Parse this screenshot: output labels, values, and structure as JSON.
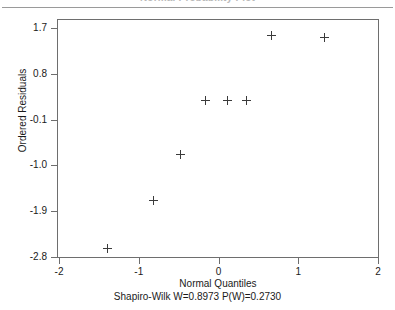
{
  "figure": {
    "cutoff_title": "Normal Probability Plot",
    "has_top_rule": true
  },
  "chart_data": {
    "type": "scatter",
    "title": "",
    "xlabel": "Normal Quantiles",
    "ylabel": "Ordered Residuals",
    "subtitle": "Shapiro-Wilk W=0.8973  P(W)=0.2730",
    "statistics": {
      "test": "Shapiro-Wilk",
      "W": 0.8973,
      "P_W": 0.273
    },
    "xlim": [
      -2.0,
      2.0
    ],
    "ylim": [
      -2.8,
      1.7
    ],
    "xticks": [
      -2,
      -1,
      0,
      1,
      2
    ],
    "xticklabels": [
      "-2",
      "-1",
      "0",
      "1",
      "2"
    ],
    "yticks": [
      1.7,
      0.8,
      -0.1,
      -1.0,
      -1.9,
      -2.8
    ],
    "yticklabels": [
      "1.7",
      "0.8",
      "-0.1",
      "-1.0",
      "-1.9",
      "-2.8"
    ],
    "grid": false,
    "legend": false,
    "marker": "plus",
    "marker_color": "#3b3b3b",
    "series": [
      {
        "name": "Ordered Residuals",
        "x": [
          -1.39,
          -0.82,
          -0.48,
          -0.16,
          0.11,
          0.35,
          0.67,
          1.33
        ],
        "y": [
          -2.63,
          -1.69,
          -0.79,
          0.27,
          0.27,
          0.27,
          1.56,
          1.52
        ]
      }
    ]
  }
}
